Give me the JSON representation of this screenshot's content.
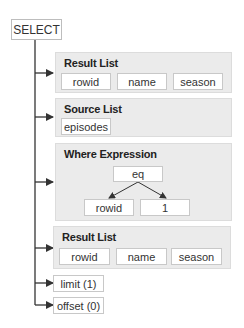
{
  "root": {
    "label": "SELECT"
  },
  "panels": {
    "result_list_1": {
      "title": "Result List",
      "items": [
        "rowid",
        "name",
        "season"
      ]
    },
    "source_list": {
      "title": "Source List",
      "items": [
        "episodes"
      ]
    },
    "where_expression": {
      "title": "Where Expression",
      "operator": "eq",
      "operands": [
        "rowid",
        "1"
      ]
    },
    "result_list_2": {
      "title": "Result List",
      "items": [
        "rowid",
        "name",
        "season"
      ]
    }
  },
  "clauses": {
    "limit": "limit (1)",
    "offset": "offset (0)"
  },
  "colors": {
    "panel_bg": "#ebebeb",
    "box_bg": "#ffffff",
    "line": "#333333"
  }
}
